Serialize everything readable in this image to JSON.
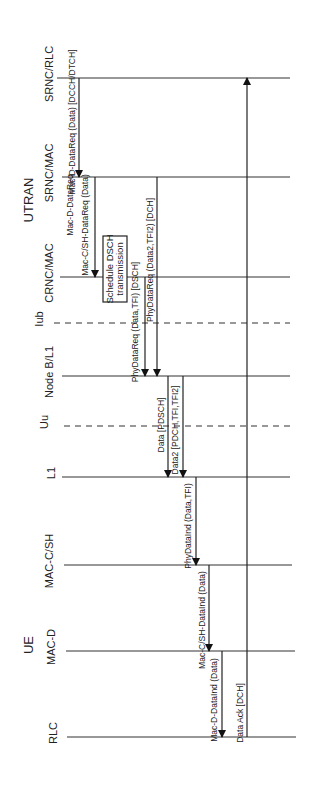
{
  "diagram": {
    "type": "sequence-diagram",
    "orientation": "rotated-90-ccw",
    "groups": [
      {
        "label": "UTRAN",
        "x": 37,
        "y": 200
      },
      {
        "label": "UE",
        "x": 37,
        "y": 645
      }
    ],
    "lifelines": [
      {
        "id": "srnc_rlc",
        "label": "SRNC/RLC",
        "y": 78,
        "x1": 57,
        "x2": 290,
        "label_x": 55,
        "label_y": 70,
        "style": "solid"
      },
      {
        "id": "srnc_mac",
        "label": "SRNC/MAC",
        "y": 177,
        "x1": 62,
        "x2": 290,
        "label_x": 55,
        "label_y": 172,
        "style": "solid"
      },
      {
        "id": "crnc_mac",
        "label": "CRNC/MAC",
        "y": 277,
        "x1": 60,
        "x2": 290,
        "label_x": 55,
        "label_y": 270,
        "style": "solid"
      },
      {
        "id": "iub",
        "label": "Iub",
        "y": 323,
        "x1": 54,
        "x2": 290,
        "label_x": 45,
        "label_y": 320,
        "style": "dashed"
      },
      {
        "id": "nodeb_l1",
        "label": "Node B/L1",
        "y": 376,
        "x1": 62,
        "x2": 290,
        "label_x": 55,
        "label_y": 375,
        "style": "solid"
      },
      {
        "id": "uu",
        "label": "Uu",
        "y": 426,
        "x1": 64,
        "x2": 290,
        "label_x": 50,
        "label_y": 424,
        "style": "dashed"
      },
      {
        "id": "ue_l1",
        "label": "L1",
        "y": 477,
        "x1": 62,
        "x2": 290,
        "label_x": 57,
        "label_y": 476,
        "style": "solid"
      },
      {
        "id": "mac_csh",
        "label": "MAC-C/SH",
        "y": 565,
        "x1": 64,
        "x2": 292,
        "label_x": 55,
        "label_y": 562,
        "style": "solid"
      },
      {
        "id": "mac_d",
        "label": "MAC-D",
        "y": 651,
        "x1": 66,
        "x2": 295,
        "label_x": 57,
        "label_y": 648,
        "style": "solid"
      },
      {
        "id": "rlc",
        "label": "RLC",
        "y": 737,
        "x1": 67,
        "x2": 296,
        "label_x": 59,
        "label_y": 735,
        "style": "solid"
      }
    ],
    "messages": [
      {
        "label": "Mac-D-DataReq (Data) [DCCH/DTCH]",
        "x": 79,
        "y1": 78,
        "y2": 177,
        "dir": "down",
        "label_x": 76,
        "label_cy": 122
      },
      {
        "label": "Mac-D-DataReq",
        "x": 92,
        "y1": 177,
        "y2": 177,
        "dir": "none",
        "label_x": 74,
        "label_cy": 205,
        "label_only": true
      },
      {
        "label": "Mac-C/SH-DataReq (Data)",
        "x": 95,
        "y1": 177,
        "y2": 277,
        "dir": "down",
        "label_x": 89,
        "label_cy": 225
      },
      {
        "label": "PhyDataReq (Data,TFI) [DSCH]",
        "x": 145,
        "y1": 277,
        "y2": 376,
        "dir": "down",
        "label_x": 139,
        "label_cy": 322
      },
      {
        "label": "PhyDataReq (Data2,TFI2) [DCH]",
        "x": 157,
        "y1": 177,
        "y2": 376,
        "dir": "down",
        "label_x": 154,
        "label_cy": 260
      },
      {
        "label": "Data [PDSCH]",
        "x": 168,
        "y1": 376,
        "y2": 477,
        "dir": "down",
        "label_x": 165,
        "label_cy": 425
      },
      {
        "label": "Data2 [PDCH,TFI,TFI2]",
        "x": 183,
        "y1": 376,
        "y2": 477,
        "dir": "down",
        "label_x": 179,
        "label_cy": 430
      },
      {
        "label": "PhyDataInd (Data,TFI)",
        "x": 196,
        "y1": 477,
        "y2": 565,
        "dir": "down",
        "label_x": 192,
        "label_cy": 526
      },
      {
        "label": "Mac-C/SH-DataInd (Data)",
        "x": 209,
        "y1": 565,
        "y2": 651,
        "dir": "down",
        "label_x": 206,
        "label_cy": 620
      },
      {
        "label": "Mac-D-DataInd (Data)",
        "x": 222,
        "y1": 651,
        "y2": 737,
        "dir": "down",
        "label_x": 218,
        "label_cy": 700
      },
      {
        "label": "Data Ack [DCH]",
        "x": 247,
        "y1": 737,
        "y2": 78,
        "dir": "up",
        "label_x": 244,
        "label_cy": 713
      }
    ],
    "activity_box": {
      "line1": "Schedule DSCH",
      "line2": "transmission",
      "x": 103,
      "y": 236,
      "w": 24,
      "h": 66
    }
  }
}
